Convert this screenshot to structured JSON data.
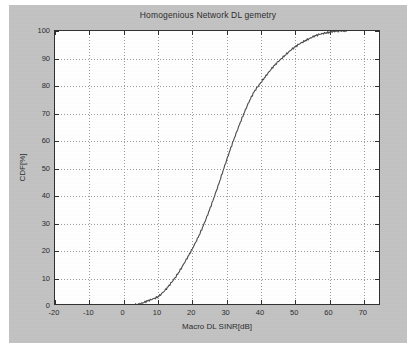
{
  "figure": {
    "background_color": "#c2c2c2",
    "axes_background_color": "#ffffff",
    "axes_border_color": "#2e2e2e",
    "grid_color": "#9a9a9a",
    "curve_color": "#4a4a4a"
  },
  "chart_data": {
    "type": "line",
    "title": "Homogenious Network DL gemetry",
    "xlabel": "Macro DL SINR[dB]",
    "ylabel": "CDF[%]",
    "xlim": [
      -20,
      75
    ],
    "ylim": [
      0,
      100
    ],
    "xticks": [
      -20,
      -10,
      0,
      10,
      20,
      30,
      40,
      50,
      60,
      70
    ],
    "xtick_labels": [
      "-20",
      "-10",
      "0",
      "10",
      "20",
      "30",
      "40",
      "50",
      "60",
      "70"
    ],
    "yticks": [
      0,
      10,
      20,
      30,
      40,
      50,
      60,
      70,
      80,
      90,
      100
    ],
    "ytick_labels": [
      "0",
      "10",
      "20",
      "30",
      "40",
      "50",
      "60",
      "70",
      "80",
      "90",
      "100"
    ],
    "grid": true,
    "grid_style": "dotted",
    "legend": null,
    "legend_position": "none",
    "series": [
      {
        "name": "Macro DL SINR CDF",
        "x": [
          -20,
          -15,
          -10,
          -5,
          -2,
          0,
          1,
          2,
          3,
          4,
          5,
          6,
          7,
          8,
          9,
          10,
          11,
          12,
          13,
          14,
          15,
          16,
          17,
          18,
          19,
          20,
          21,
          22,
          23,
          24,
          25,
          26,
          27,
          28,
          29,
          30,
          31,
          32,
          33,
          34,
          35,
          36,
          37,
          38,
          39,
          40,
          41,
          42,
          43,
          44,
          45,
          46,
          47,
          48,
          49,
          50,
          51,
          52,
          53,
          54,
          55,
          56,
          57,
          58,
          59,
          60,
          61,
          62,
          63,
          64,
          65
        ],
        "y": [
          0,
          0,
          0,
          0,
          0,
          0.1,
          0.2,
          0.3,
          0.4,
          0.6,
          0.9,
          1.3,
          1.8,
          2.3,
          2.8,
          3.4,
          4.4,
          5.6,
          7.0,
          8.6,
          10.3,
          12.2,
          14.2,
          16.3,
          18.4,
          20.7,
          23.2,
          25.8,
          28.6,
          31.6,
          34.8,
          38.2,
          41.8,
          45.5,
          49.3,
          53.0,
          56.6,
          60.1,
          63.5,
          66.8,
          69.9,
          72.8,
          75.4,
          77.8,
          79.6,
          81.3,
          83.0,
          84.6,
          86.1,
          87.5,
          88.8,
          90.0,
          91.2,
          92.3,
          93.3,
          94.2,
          95.1,
          95.9,
          96.6,
          97.2,
          97.8,
          98.3,
          98.7,
          99.1,
          99.4,
          99.6,
          99.8,
          99.9,
          100,
          100,
          100
        ]
      }
    ],
    "annotations": [],
    "reference_points": [
      {
        "label": "10%",
        "x": 14.8,
        "y": 10
      },
      {
        "label": "20%",
        "x": 19.6,
        "y": 20
      },
      {
        "label": "30%",
        "x": 22.6,
        "y": 30
      },
      {
        "label": "40%",
        "x": 25.0,
        "y": 40
      },
      {
        "label": "50%",
        "x": 27.4,
        "y": 50
      },
      {
        "label": "60%",
        "x": 30.5,
        "y": 60
      },
      {
        "label": "70%",
        "x": 34.1,
        "y": 70
      },
      {
        "label": "80%",
        "x": 39.8,
        "y": 80
      },
      {
        "label": "90%",
        "x": 48.4,
        "y": 90
      },
      {
        "label": "100%",
        "x": 60.5,
        "y": 100
      }
    ]
  }
}
